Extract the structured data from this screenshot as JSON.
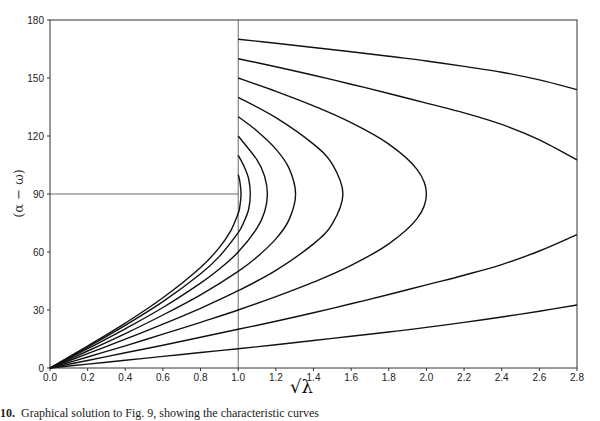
{
  "figure": {
    "caption_number": "10.",
    "caption_text": "Graphical solution to Fig. 9, showing the characteristic curves"
  },
  "chart_data": {
    "type": "line",
    "title": "",
    "xlabel": "√λ",
    "ylabel": "(α − ω)",
    "xlim": [
      0,
      2.8
    ],
    "ylim": [
      0,
      180
    ],
    "xticks": [
      0.0,
      0.2,
      0.4,
      0.6,
      0.8,
      1.0,
      1.2,
      1.4,
      1.6,
      1.8,
      2.0,
      2.2,
      2.4,
      2.6,
      2.8
    ],
    "xtick_labels": [
      "0.0",
      "0.2",
      "0.4",
      "0.6",
      "0.8",
      "1.0",
      "1.2",
      "1.4",
      "1.6",
      "1.8",
      "2.0",
      "2.2",
      "2.4",
      "2.6",
      "2.8"
    ],
    "yticks": [
      0,
      30,
      60,
      90,
      120,
      150,
      180
    ],
    "ytick_labels": [
      "0",
      "30",
      "60",
      "90",
      "120",
      "150",
      "180"
    ],
    "grid": false,
    "legend": null,
    "reference_lines": [
      {
        "orientation": "vertical",
        "x": 1.0,
        "y_from": 0,
        "y_to": 180
      },
      {
        "orientation": "horizontal",
        "y": 90,
        "x_from": 0,
        "x_to": 1.0
      }
    ],
    "series": [
      {
        "name": "10",
        "points": [
          [
            0,
            0
          ],
          [
            0.2,
            2
          ],
          [
            0.4,
            4
          ],
          [
            0.6,
            6
          ],
          [
            0.8,
            8
          ],
          [
            1.0,
            10
          ],
          [
            1.2,
            12
          ],
          [
            1.4,
            14.2
          ],
          [
            1.6,
            16.4
          ],
          [
            1.8,
            18.6
          ],
          [
            2.0,
            21
          ],
          [
            2.2,
            23.6
          ],
          [
            2.4,
            26.4
          ],
          [
            2.6,
            29.4
          ],
          [
            2.8,
            32.6
          ]
        ]
      },
      {
        "name": "170",
        "points": [
          [
            1.0,
            170
          ],
          [
            1.2,
            168
          ],
          [
            1.4,
            165.8
          ],
          [
            1.6,
            163.6
          ],
          [
            1.8,
            161.2
          ],
          [
            2.0,
            158.8
          ],
          [
            2.2,
            156
          ],
          [
            2.4,
            153
          ],
          [
            2.6,
            149
          ],
          [
            2.8,
            144
          ]
        ]
      },
      {
        "name": "20",
        "points": [
          [
            0,
            0
          ],
          [
            0.2,
            3.9
          ],
          [
            0.4,
            7.9
          ],
          [
            0.6,
            11.8
          ],
          [
            0.8,
            15.9
          ],
          [
            1.0,
            20
          ],
          [
            1.2,
            24.2
          ],
          [
            1.4,
            28.6
          ],
          [
            1.6,
            33.2
          ],
          [
            1.8,
            38
          ],
          [
            2.0,
            43
          ],
          [
            2.2,
            48
          ],
          [
            2.4,
            53.5
          ],
          [
            2.6,
            60.5
          ],
          [
            2.8,
            69
          ]
        ]
      },
      {
        "name": "160",
        "points": [
          [
            1.0,
            160
          ],
          [
            1.2,
            155.8
          ],
          [
            1.4,
            151.4
          ],
          [
            1.6,
            146.8
          ],
          [
            1.8,
            142
          ],
          [
            2.0,
            137
          ],
          [
            2.2,
            132
          ],
          [
            2.4,
            126
          ],
          [
            2.6,
            118
          ],
          [
            2.8,
            107.6
          ]
        ]
      },
      {
        "name": "30-150",
        "points": [
          [
            0,
            0
          ],
          [
            0.2,
            5.7
          ],
          [
            0.4,
            11.5
          ],
          [
            0.6,
            17.5
          ],
          [
            0.8,
            23.6
          ],
          [
            1.0,
            30
          ],
          [
            1.2,
            36.9
          ],
          [
            1.4,
            44.4
          ],
          [
            1.6,
            53.1
          ],
          [
            1.8,
            64.2
          ],
          [
            1.95,
            77.2
          ],
          [
            2.0,
            90
          ],
          [
            1.95,
            102.8
          ],
          [
            1.8,
            115.8
          ],
          [
            1.6,
            126.9
          ],
          [
            1.4,
            135.6
          ],
          [
            1.2,
            143.1
          ],
          [
            1.0,
            150
          ]
        ]
      },
      {
        "name": "40-140",
        "points": [
          [
            0,
            0
          ],
          [
            0.2,
            7.4
          ],
          [
            0.4,
            14.9
          ],
          [
            0.6,
            22.7
          ],
          [
            0.8,
            30.9
          ],
          [
            1.0,
            40
          ],
          [
            1.2,
            50.5
          ],
          [
            1.4,
            64.2
          ],
          [
            1.5,
            74.6
          ],
          [
            1.556,
            90
          ],
          [
            1.5,
            105.4
          ],
          [
            1.4,
            115.8
          ],
          [
            1.2,
            129.5
          ],
          [
            1.0,
            140
          ]
        ]
      },
      {
        "name": "50-130",
        "points": [
          [
            0,
            0
          ],
          [
            0.2,
            8.8
          ],
          [
            0.4,
            17.8
          ],
          [
            0.6,
            27.4
          ],
          [
            0.8,
            37.8
          ],
          [
            1.0,
            50
          ],
          [
            1.1,
            57.4
          ],
          [
            1.2,
            66.8
          ],
          [
            1.27,
            76.6
          ],
          [
            1.305,
            90
          ],
          [
            1.27,
            103.4
          ],
          [
            1.2,
            113.2
          ],
          [
            1.1,
            122.6
          ],
          [
            1.0,
            130
          ]
        ]
      },
      {
        "name": "60-120",
        "points": [
          [
            0,
            0
          ],
          [
            0.2,
            10
          ],
          [
            0.4,
            20.3
          ],
          [
            0.6,
            31.3
          ],
          [
            0.8,
            43.9
          ],
          [
            0.9,
            51.2
          ],
          [
            1.0,
            60
          ],
          [
            1.1,
            72.3
          ],
          [
            1.14,
            80.8
          ],
          [
            1.155,
            90
          ],
          [
            1.14,
            99.2
          ],
          [
            1.1,
            107.7
          ],
          [
            1.0,
            120
          ]
        ]
      },
      {
        "name": "70-110",
        "points": [
          [
            0,
            0
          ],
          [
            0.2,
            10.8
          ],
          [
            0.4,
            22.1
          ],
          [
            0.6,
            34.3
          ],
          [
            0.8,
            48.7
          ],
          [
            0.9,
            57.7
          ],
          [
            1.0,
            70
          ],
          [
            1.03,
            75.5
          ],
          [
            1.055,
            82
          ],
          [
            1.064,
            90
          ],
          [
            1.055,
            98
          ],
          [
            1.03,
            104.5
          ],
          [
            1.0,
            110
          ]
        ]
      },
      {
        "name": "80-100",
        "points": [
          [
            0,
            0
          ],
          [
            0.2,
            11.4
          ],
          [
            0.4,
            23.2
          ],
          [
            0.6,
            36.3
          ],
          [
            0.8,
            52
          ],
          [
            0.9,
            62.4
          ],
          [
            0.96,
            70.9
          ],
          [
            1.0,
            80
          ],
          [
            1.008,
            83.1
          ],
          [
            1.015,
            90
          ],
          [
            1.008,
            96.9
          ],
          [
            1.0,
            100
          ]
        ]
      }
    ]
  }
}
